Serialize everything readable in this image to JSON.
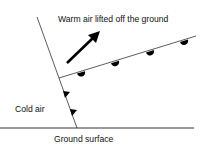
{
  "diagram": {
    "labels": {
      "warm_air": "Warm air lifted off the ground",
      "cold_air": "Cold air",
      "ground": "Ground surface"
    },
    "elements": {
      "cold_front": "cold-front-line-with-triangles",
      "warm_front": "warm-front-line-with-semicircles",
      "arrow": "upward-arrow",
      "ground_line": "ground-surface-line"
    },
    "colors": {
      "line": "#333333",
      "symbols": "#000000",
      "text": "#111111",
      "background": "#ffffff"
    }
  }
}
